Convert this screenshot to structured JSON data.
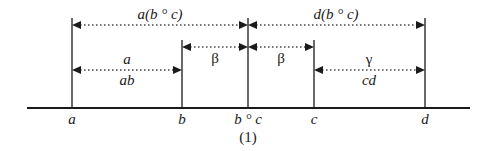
{
  "figure_label": "(1)",
  "axis_points": [
    {
      "label": "a",
      "x": 72
    },
    {
      "label": "b",
      "x": 182
    },
    {
      "label": "b ° c",
      "x": 248
    },
    {
      "label": "c",
      "x": 314
    },
    {
      "label": "d",
      "x": 425
    }
  ],
  "intervals": {
    "top_left": {
      "label": "a(b ° c)",
      "from": "a",
      "to": "b ° c"
    },
    "top_right": {
      "label": "d(b ° c)",
      "from": "b ° c",
      "to": "d"
    },
    "mid_left": {
      "label": "β",
      "from": "b",
      "to": "b ° c"
    },
    "mid_right": {
      "label": "β",
      "from": "b ° c",
      "to": "c"
    },
    "low_left": {
      "label_top": "a",
      "label_bottom": "ab",
      "from": "a",
      "to": "b"
    },
    "low_right": {
      "label_top": "γ",
      "label_bottom": "cd",
      "from": "c",
      "to": "d"
    }
  }
}
